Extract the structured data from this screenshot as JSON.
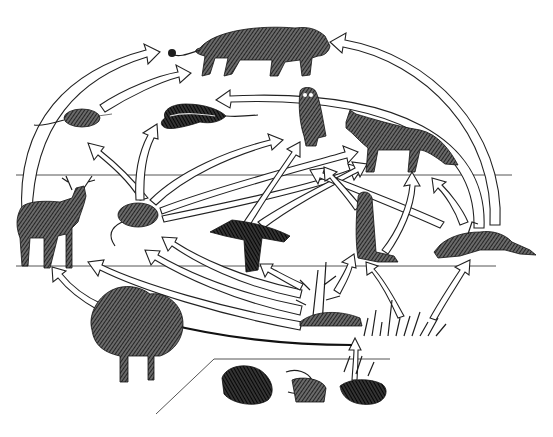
{
  "diagram": {
    "type": "food-web",
    "background": "#ffffff",
    "ink_color": "#1e1e1e",
    "levels": [
      {
        "name": "tertiary-consumers",
        "y_range": [
          0,
          175
        ]
      },
      {
        "name": "primary-consumers",
        "y_range": [
          175,
          268
        ]
      },
      {
        "name": "producers",
        "y_range": [
          268,
          340
        ]
      },
      {
        "name": "decomposers",
        "y_range": [
          340,
          437
        ]
      }
    ],
    "organisms": [
      {
        "id": "mountain-lion",
        "label": "",
        "x": 245,
        "y": 50
      },
      {
        "id": "snake",
        "label": "",
        "x": 205,
        "y": 120
      },
      {
        "id": "shrew",
        "label": "",
        "x": 75,
        "y": 120
      },
      {
        "id": "owl",
        "label": "",
        "x": 315,
        "y": 115
      },
      {
        "id": "fox",
        "label": "",
        "x": 395,
        "y": 140
      },
      {
        "id": "deer",
        "label": "",
        "x": 50,
        "y": 225
      },
      {
        "id": "mouse",
        "label": "",
        "x": 140,
        "y": 220
      },
      {
        "id": "crow",
        "label": "",
        "x": 250,
        "y": 235
      },
      {
        "id": "prairie-dog",
        "label": "",
        "x": 365,
        "y": 225
      },
      {
        "id": "rabbit",
        "label": "",
        "x": 480,
        "y": 240
      },
      {
        "id": "trees",
        "label": "",
        "x": 135,
        "y": 330
      },
      {
        "id": "corn-plants",
        "label": "",
        "x": 320,
        "y": 290
      },
      {
        "id": "grasses",
        "label": "",
        "x": 400,
        "y": 320
      },
      {
        "id": "decomposers",
        "label": "",
        "x": 300,
        "y": 395
      }
    ],
    "edges": [
      {
        "from": "shrew",
        "to": "mountain-lion"
      },
      {
        "from": "deer",
        "to": "mountain-lion"
      },
      {
        "from": "rabbit",
        "to": "mountain-lion"
      },
      {
        "from": "rabbit",
        "to": "snake"
      },
      {
        "from": "mouse",
        "to": "shrew"
      },
      {
        "from": "mouse",
        "to": "snake"
      },
      {
        "from": "mouse",
        "to": "owl"
      },
      {
        "from": "mouse",
        "to": "fox"
      },
      {
        "from": "crow",
        "to": "owl"
      },
      {
        "from": "crow",
        "to": "fox"
      },
      {
        "from": "prairie-dog",
        "to": "owl"
      },
      {
        "from": "prairie-dog",
        "to": "fox"
      },
      {
        "from": "rabbit",
        "to": "fox"
      },
      {
        "from": "trees",
        "to": "deer"
      },
      {
        "from": "corn-plants",
        "to": "mouse"
      },
      {
        "from": "corn-plants",
        "to": "crow"
      },
      {
        "from": "corn-plants",
        "to": "prairie-dog"
      },
      {
        "from": "grasses",
        "to": "prairie-dog"
      },
      {
        "from": "grasses",
        "to": "rabbit"
      },
      {
        "from": "grasses",
        "to": "mouse"
      },
      {
        "from": "decomposers",
        "to": "corn-plants"
      }
    ]
  }
}
